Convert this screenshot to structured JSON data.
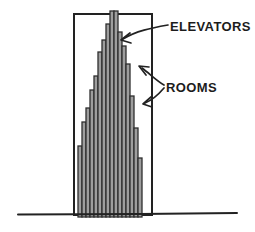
{
  "figure": {
    "background": "#ffffff",
    "ink": "#222222",
    "bar_fill": "#9e9e9e",
    "bar_edge": "#2e2e2e",
    "labels": {
      "elevators": "ELEVATORS",
      "rooms": "ROOMS"
    },
    "building": {
      "x": 74,
      "y": 14,
      "width": 78,
      "height": 201
    },
    "ground": {
      "path": "M 18 214.5 L 140 214 L 237 213"
    },
    "bars": {
      "x_start": 78,
      "bar_width": 4,
      "bottom": 217,
      "tops": [
        146,
        122,
        108,
        90,
        76,
        52,
        40,
        24,
        11,
        11,
        32,
        46,
        64,
        96,
        128,
        158
      ]
    },
    "annotations": {
      "elevators_arrow": {
        "path": "M 168 25 C 151 28 136 31 123 39",
        "head": "M 130 33 L 121 40 L 131 43",
        "label_x": "170",
        "label_y": "31"
      },
      "rooms_arrow_upper": {
        "path": "M 164 85 C 157 81 150 74 142 68",
        "head": "M 149 67 L 139 66 L 146 75"
      },
      "rooms_arrow_lower": {
        "path": "M 164 88 C 158 95 153 100 145 103",
        "head": "M 151 97 L 143 104 L 152 107",
        "label_x": "166",
        "label_y": "92"
      }
    }
  }
}
